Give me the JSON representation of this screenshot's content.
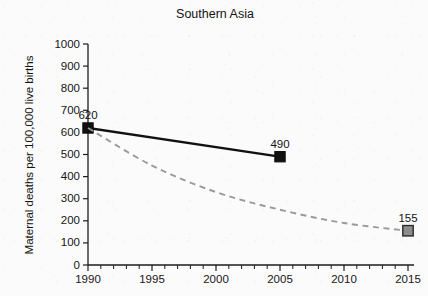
{
  "chart_data": {
    "type": "line",
    "title": "Southern Asia",
    "xlabel": "",
    "ylabel": "Maternal deaths per 100,000 live births",
    "xlim": [
      1990,
      2015
    ],
    "ylim": [
      0,
      1000
    ],
    "grid": false,
    "legend": "none",
    "x_ticks": [
      "1990",
      "1995",
      "2000",
      "2005",
      "2010",
      "2015"
    ],
    "x_tick_values": [
      1990,
      1995,
      2000,
      2005,
      2010,
      2015
    ],
    "x_minor_tick_step": 1,
    "y_ticks": [
      "0",
      "100",
      "200",
      "300",
      "400",
      "500",
      "600",
      "700",
      "800",
      "900",
      "1000"
    ],
    "y_tick_values": [
      0,
      100,
      200,
      300,
      400,
      500,
      600,
      700,
      800,
      900,
      1000
    ],
    "series": [
      {
        "name": "Observed maternal mortality ratio",
        "style": "solid",
        "color": "#111111",
        "marker": "filled-square",
        "x": [
          1990,
          2005
        ],
        "values": [
          620,
          490
        ],
        "point_labels": [
          "620",
          "490"
        ]
      },
      {
        "name": "MDG target trajectory",
        "style": "dashed",
        "color": "#9a9a9a",
        "marker": "gray-square",
        "x": [
          1990,
          1995,
          2000,
          2005,
          2010,
          2015
        ],
        "values": [
          620,
          450,
          330,
          250,
          190,
          155
        ],
        "point_labels": [
          "",
          "",
          "",
          "",
          "",
          "155"
        ]
      }
    ],
    "annotations": [
      {
        "text": "620",
        "x": 1990,
        "y": 620
      },
      {
        "text": "490",
        "x": 2005,
        "y": 490
      },
      {
        "text": "155",
        "x": 2015,
        "y": 155
      }
    ]
  },
  "colors": {
    "background": "#fbfbfb",
    "axis": "#1d1d1d",
    "text": "#141414",
    "series_observed": "#111111",
    "series_target": "#9a9a9a",
    "marker_target_fill": "#8c8c8c"
  }
}
